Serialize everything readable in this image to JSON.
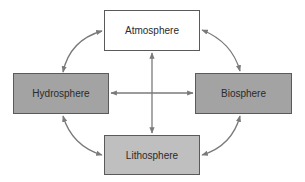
{
  "diagram": {
    "nodes": [
      {
        "id": "atmosphere",
        "label": "Atmosphere",
        "fill": "#ffffff"
      },
      {
        "id": "hydrosphere",
        "label": "Hydrosphere",
        "fill": "#a3a3a3"
      },
      {
        "id": "biosphere",
        "label": "Biosphere",
        "fill": "#a3a3a3"
      },
      {
        "id": "lithosphere",
        "label": "Lithosphere",
        "fill": "#bfbfbf"
      }
    ],
    "edges": [
      {
        "from": "atmosphere",
        "to": "hydrosphere",
        "type": "curved",
        "direction": "bidirectional"
      },
      {
        "from": "atmosphere",
        "to": "biosphere",
        "type": "curved",
        "direction": "bidirectional"
      },
      {
        "from": "hydrosphere",
        "to": "lithosphere",
        "type": "curved",
        "direction": "bidirectional"
      },
      {
        "from": "biosphere",
        "to": "lithosphere",
        "type": "curved",
        "direction": "bidirectional"
      },
      {
        "from": "atmosphere",
        "to": "lithosphere",
        "type": "straight",
        "direction": "bidirectional"
      },
      {
        "from": "hydrosphere",
        "to": "biosphere",
        "type": "straight",
        "direction": "bidirectional"
      }
    ],
    "arrow_color": "#7a7a7a"
  }
}
